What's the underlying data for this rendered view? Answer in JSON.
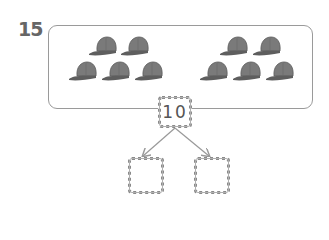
{
  "question": {
    "number": "15"
  },
  "groups": [
    {
      "name": "left-group",
      "count": 5,
      "item": "cap-icon"
    },
    {
      "name": "right-group",
      "count": 5,
      "item": "cap-icon"
    }
  ],
  "number_bond": {
    "total": "10",
    "parts": [
      "",
      ""
    ]
  },
  "colors": {
    "cap": "#7a7a7a",
    "border": "#9a9a9a",
    "text": "#666666"
  }
}
